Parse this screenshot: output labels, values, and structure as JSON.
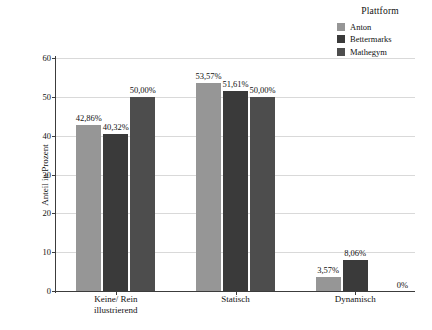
{
  "chart_data": {
    "type": "bar",
    "title": "",
    "subtitle": "",
    "xlabel": "",
    "ylabel": "Anteil in Prozent",
    "ylim": [
      0,
      60
    ],
    "yticks": [
      0,
      10,
      20,
      30,
      40,
      50,
      60
    ],
    "ytick_labels": [
      "0",
      "10",
      "20",
      "30",
      "40",
      "50",
      "60"
    ],
    "grid": true,
    "legend_position": "top-right",
    "legend_title": "Plattform",
    "categories": [
      "Keine/ Rein\nillustrierend",
      "Statisch",
      "Dynamisch"
    ],
    "category_labels": [
      "Keine/ Rein illustrierend",
      "Statisch",
      "Dynamisch"
    ],
    "series": [
      {
        "name": "Anton",
        "color": "#969696",
        "values": [
          42.86,
          53.57,
          3.57
        ],
        "value_labels": [
          "42,86%",
          "53,57%",
          "3,57%"
        ]
      },
      {
        "name": "Bettermarks",
        "color": "#3a3a3a",
        "values": [
          40.32,
          51.61,
          8.06
        ],
        "value_labels": [
          "40,32%",
          "51,61%",
          "8,06%"
        ]
      },
      {
        "name": "Mathegym",
        "color": "#4d4d4d",
        "values": [
          50.0,
          50.0,
          0
        ],
        "value_labels": [
          "50,00%",
          "50,00%",
          "0%"
        ]
      }
    ]
  },
  "legend": {
    "title": "Plattform",
    "items": [
      {
        "label": "Anton",
        "color": "#969696"
      },
      {
        "label": "Bettermarks",
        "color": "#3a3a3a"
      },
      {
        "label": "Mathegym",
        "color": "#4d4d4d"
      }
    ]
  },
  "axes": {
    "y_title": "Anteil in Prozent",
    "y_ticks": [
      "0",
      "10",
      "20",
      "30",
      "40",
      "50",
      "60"
    ],
    "x_ticks": [
      "Keine/ Rein\nillustrierend",
      "Statisch",
      "Dynamisch"
    ]
  }
}
